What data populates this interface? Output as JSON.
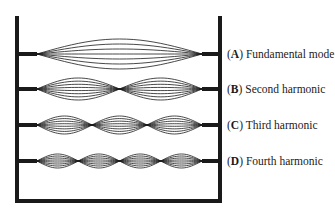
{
  "figure": {
    "frame": {
      "left_post_x": 17,
      "right_post_x": 220,
      "top_y": 16,
      "bottom_y": 201,
      "color": "#1a1a1a"
    },
    "string_span": {
      "start_x": 37,
      "end_x": 202
    },
    "modes": [
      {
        "letter": "A",
        "name": "Fundamental mode",
        "loops": 1,
        "y": 54,
        "amplitude": 15,
        "curves": 7
      },
      {
        "letter": "B",
        "name": "Second harmonic",
        "loops": 2,
        "y": 89,
        "amplitude": 11,
        "curves": 8
      },
      {
        "letter": "C",
        "name": "Third harmonic",
        "loops": 3,
        "y": 125,
        "amplitude": 9,
        "curves": 8
      },
      {
        "letter": "D",
        "name": "Fourth harmonic",
        "loops": 4,
        "y": 161,
        "amplitude": 7,
        "curves": 8
      }
    ]
  }
}
